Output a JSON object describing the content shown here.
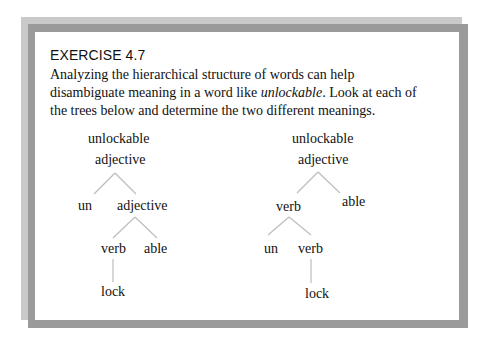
{
  "exercise": {
    "title": "EXERCISE 4.7",
    "intro_before": "Analyzing the hierarchical structure of words can help disambiguate meaning in a word like ",
    "intro_italic": "unlockable",
    "intro_after": ". Look at each of the trees below and determine the two different meanings."
  },
  "trees": {
    "left": {
      "word": "unlockable",
      "root": "adjective",
      "level1_left": "un",
      "level1_right": "adjective",
      "level2_left": "verb",
      "level2_right": "able",
      "leaf": "lock"
    },
    "right": {
      "word": "unlockable",
      "root": "adjective",
      "level1_left": "verb",
      "level1_right": "able",
      "level2_left": "un",
      "level2_right": "verb",
      "leaf": "lock"
    }
  },
  "colors": {
    "outer_shadow": "#c9c9c9",
    "frame": "#9a9a9a",
    "panel": "#ffffff",
    "tree_lines": "#bdbdbd"
  }
}
